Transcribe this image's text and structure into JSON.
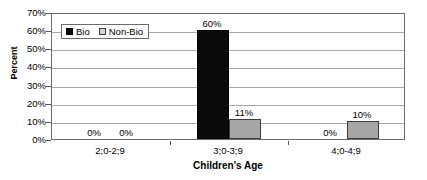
{
  "chart_data": {
    "type": "bar",
    "title": "",
    "xlabel": "Children's Age",
    "ylabel": "Percent",
    "categories": [
      "2;0-2;9",
      "3;0-3;9",
      "4;0-4;9"
    ],
    "series": [
      {
        "name": "Bio",
        "values": [
          0,
          60,
          0
        ],
        "labels": [
          "0%",
          "60%",
          "0%"
        ],
        "color": "#0a0a0a"
      },
      {
        "name": "Non-Bio",
        "values": [
          0,
          11,
          10
        ],
        "labels": [
          "0%",
          "11%",
          "10%"
        ],
        "color": "#a6a6a6"
      }
    ],
    "ylim": [
      0,
      70
    ],
    "ytick_values": [
      70,
      60,
      50,
      40,
      30,
      20,
      10,
      0
    ],
    "ytick_labels": [
      "70%",
      "60%",
      "50%",
      "40%",
      "30%",
      "20%",
      "10%",
      "0%"
    ],
    "grid": true,
    "legend_position": "upper-left-inside"
  },
  "legend": {
    "entries": [
      {
        "label": "Bio",
        "swatch": "black-square"
      },
      {
        "label": "Non-Bio",
        "swatch": "gray-square"
      }
    ]
  }
}
